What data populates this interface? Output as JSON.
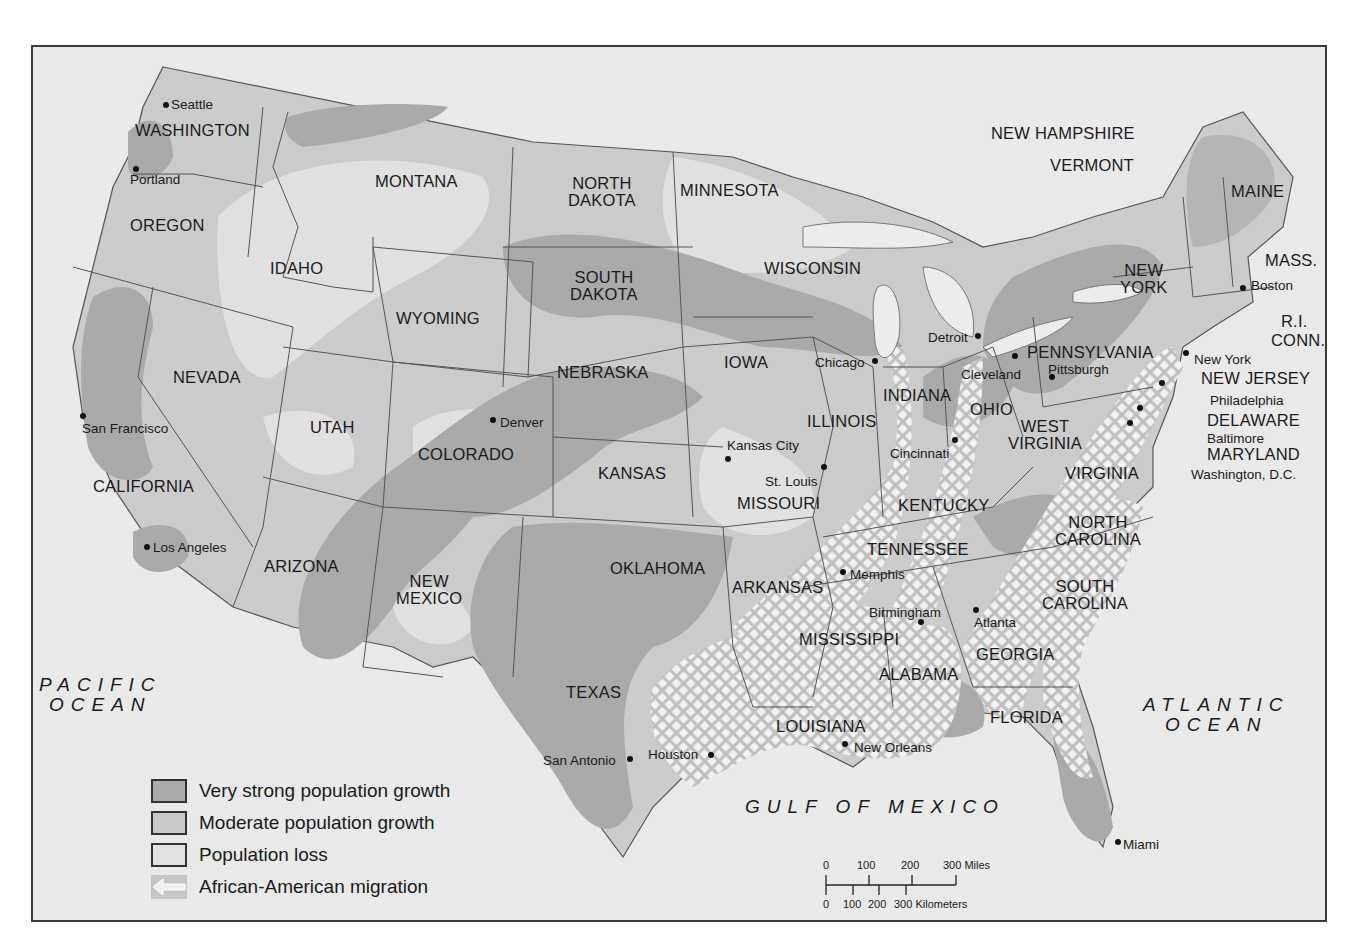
{
  "colors": {
    "frame_bg": "#e6e6e6",
    "very_strong": "#a9a9a9",
    "moderate": "#c9c9c9",
    "loss": "#e2e2e2",
    "migration": "#f4f4f4",
    "border": "#555555",
    "text": "#1a1a1a"
  },
  "states": [
    {
      "id": "washington",
      "label": "WASHINGTON",
      "x": 102,
      "y": 75
    },
    {
      "id": "oregon",
      "label": "OREGON",
      "x": 97,
      "y": 170
    },
    {
      "id": "california",
      "label": "CALIFORNIA",
      "x": 60,
      "y": 431
    },
    {
      "id": "nevada",
      "label": "NEVADA",
      "x": 140,
      "y": 322
    },
    {
      "id": "idaho",
      "label": "IDAHO",
      "x": 237,
      "y": 213
    },
    {
      "id": "montana",
      "label": "MONTANA",
      "x": 342,
      "y": 126
    },
    {
      "id": "wyoming",
      "label": "WYOMING",
      "x": 363,
      "y": 263
    },
    {
      "id": "utah",
      "label": "UTAH",
      "x": 277,
      "y": 372
    },
    {
      "id": "arizona",
      "label": "ARIZONA",
      "x": 231,
      "y": 511
    },
    {
      "id": "colorado",
      "label": "COLORADO",
      "x": 385,
      "y": 399
    },
    {
      "id": "new-mexico",
      "label": "NEW\nMEXICO",
      "x": 363,
      "y": 526
    },
    {
      "id": "north-dakota",
      "label": "NORTH\nDAKOTA",
      "x": 535,
      "y": 128
    },
    {
      "id": "south-dakota",
      "label": "SOUTH\nDAKOTA",
      "x": 537,
      "y": 222
    },
    {
      "id": "nebraska",
      "label": "NEBRASKA",
      "x": 524,
      "y": 317
    },
    {
      "id": "kansas",
      "label": "KANSAS",
      "x": 565,
      "y": 418
    },
    {
      "id": "oklahoma",
      "label": "OKLAHOMA",
      "x": 577,
      "y": 513
    },
    {
      "id": "texas",
      "label": "TEXAS",
      "x": 533,
      "y": 637
    },
    {
      "id": "minnesota",
      "label": "MINNESOTA",
      "x": 647,
      "y": 135
    },
    {
      "id": "iowa",
      "label": "IOWA",
      "x": 691,
      "y": 307
    },
    {
      "id": "missouri",
      "label": "MISSOURI",
      "x": 704,
      "y": 448
    },
    {
      "id": "arkansas",
      "label": "ARKANSAS",
      "x": 699,
      "y": 532
    },
    {
      "id": "louisiana",
      "label": "LOUISIANA",
      "x": 743,
      "y": 671
    },
    {
      "id": "wisconsin",
      "label": "WISCONSIN",
      "x": 731,
      "y": 213
    },
    {
      "id": "illinois",
      "label": "ILLINOIS",
      "x": 774,
      "y": 366
    },
    {
      "id": "indiana",
      "label": "INDIANA",
      "x": 850,
      "y": 340
    },
    {
      "id": "mississippi",
      "label": "MISSISSIPPI",
      "x": 766,
      "y": 584
    },
    {
      "id": "tennessee",
      "label": "TENNESSEE",
      "x": 834,
      "y": 494
    },
    {
      "id": "kentucky",
      "label": "KENTUCKY",
      "x": 865,
      "y": 450
    },
    {
      "id": "alabama",
      "label": "ALABAMA",
      "x": 846,
      "y": 619
    },
    {
      "id": "georgia",
      "label": "GEORGIA",
      "x": 943,
      "y": 599
    },
    {
      "id": "florida",
      "label": "FLORIDA",
      "x": 957,
      "y": 662
    },
    {
      "id": "ohio",
      "label": "OHIO",
      "x": 937,
      "y": 354
    },
    {
      "id": "west-virginia",
      "label": "WEST\nVIRGINIA",
      "x": 975,
      "y": 371
    },
    {
      "id": "virginia",
      "label": "VIRGINIA",
      "x": 1032,
      "y": 418
    },
    {
      "id": "north-carolina",
      "label": "NORTH\nCAROLINA",
      "x": 1022,
      "y": 467
    },
    {
      "id": "south-carolina",
      "label": "SOUTH\nCAROLINA",
      "x": 1009,
      "y": 531
    },
    {
      "id": "pennsylvania",
      "label": "PENNSYLVANIA",
      "x": 994,
      "y": 297
    },
    {
      "id": "new-york",
      "label": "NEW\nYORK",
      "x": 1087,
      "y": 215
    },
    {
      "id": "new-jersey",
      "label": "NEW JERSEY",
      "x": 1168,
      "y": 323
    },
    {
      "id": "delaware",
      "label": "DELAWARE",
      "x": 1174,
      "y": 365
    },
    {
      "id": "maryland",
      "label": "MARYLAND",
      "x": 1174,
      "y": 399
    },
    {
      "id": "maine",
      "label": "MAINE",
      "x": 1198,
      "y": 136
    },
    {
      "id": "mass",
      "label": "MASS.",
      "x": 1232,
      "y": 205
    },
    {
      "id": "ri",
      "label": "R.I.",
      "x": 1248,
      "y": 266
    },
    {
      "id": "conn",
      "label": "CONN.",
      "x": 1238,
      "y": 285
    },
    {
      "id": "new-hampshire",
      "label": "NEW HAMPSHIRE",
      "x": 958,
      "y": 78
    },
    {
      "id": "vermont",
      "label": "VERMONT",
      "x": 1017,
      "y": 110
    }
  ],
  "cities": [
    {
      "id": "seattle",
      "label": "Seattle",
      "dx": 133,
      "dy": 58,
      "lx": 138,
      "ly": 51
    },
    {
      "id": "portland",
      "label": "Portland",
      "dx": 103,
      "dy": 122,
      "lx": 97,
      "ly": 126
    },
    {
      "id": "san-francisco",
      "label": "San Francisco",
      "dx": 50,
      "dy": 369,
      "lx": 49,
      "ly": 375
    },
    {
      "id": "los-angeles",
      "label": "Los Angeles",
      "dx": 114,
      "dy": 500,
      "lx": 120,
      "ly": 494
    },
    {
      "id": "denver",
      "label": "Denver",
      "dx": 460,
      "dy": 373,
      "lx": 467,
      "ly": 369
    },
    {
      "id": "kansas-city",
      "label": "Kansas City",
      "dx": 695,
      "dy": 412,
      "lx": 694,
      "ly": 392
    },
    {
      "id": "st-louis",
      "label": "St. Louis",
      "dx": 791,
      "dy": 420,
      "lx": 732,
      "ly": 428
    },
    {
      "id": "chicago",
      "label": "Chicago",
      "dx": 842,
      "dy": 314,
      "lx": 782,
      "ly": 309
    },
    {
      "id": "detroit",
      "label": "Detroit",
      "dx": 945,
      "dy": 289,
      "lx": 895,
      "ly": 284
    },
    {
      "id": "cleveland",
      "label": "Cleveland",
      "dx": 982,
      "dy": 309,
      "lx": 928,
      "ly": 321
    },
    {
      "id": "pittsburgh",
      "label": "Pittsburgh",
      "dx": 1019,
      "dy": 330,
      "lx": 1015,
      "ly": 316
    },
    {
      "id": "cincinnati",
      "label": "Cincinnati",
      "dx": 922,
      "dy": 393,
      "lx": 857,
      "ly": 400
    },
    {
      "id": "memphis",
      "label": "Memphis",
      "dx": 810,
      "dy": 525,
      "lx": 817,
      "ly": 521
    },
    {
      "id": "birmingham",
      "label": "Birmingham",
      "dx": 888,
      "dy": 575,
      "lx": 836,
      "ly": 559
    },
    {
      "id": "atlanta",
      "label": "Atlanta",
      "dx": 943,
      "dy": 563,
      "lx": 941,
      "ly": 569
    },
    {
      "id": "new-orleans",
      "label": "New Orleans",
      "dx": 812,
      "dy": 697,
      "lx": 821,
      "ly": 694
    },
    {
      "id": "houston",
      "label": "Houston",
      "dx": 678,
      "dy": 708,
      "lx": 615,
      "ly": 701
    },
    {
      "id": "san-antonio",
      "label": "San Antonio",
      "dx": 597,
      "dy": 712,
      "lx": 510,
      "ly": 707
    },
    {
      "id": "miami",
      "label": "Miami",
      "dx": 1085,
      "dy": 795,
      "lx": 1090,
      "ly": 791
    },
    {
      "id": "boston",
      "label": "Boston",
      "dx": 1210,
      "dy": 241,
      "lx": 1218,
      "ly": 232
    },
    {
      "id": "new-york-city",
      "label": "New York",
      "dx": 1153,
      "dy": 306,
      "lx": 1161,
      "ly": 306
    },
    {
      "id": "philadelphia",
      "label": "Philadelphia",
      "dx": 1129,
      "dy": 336,
      "lx": 1177,
      "ly": 347
    },
    {
      "id": "baltimore",
      "label": "Baltimore",
      "dx": 1107,
      "dy": 361,
      "lx": 1174,
      "ly": 385
    },
    {
      "id": "washington-dc",
      "label": "Washington, D.C.",
      "dx": 1097,
      "dy": 376,
      "lx": 1158,
      "ly": 421
    }
  ],
  "oceans": [
    {
      "id": "pacific-ocean",
      "label": "PACIFIC\nOCEAN",
      "x": 6,
      "y": 628
    },
    {
      "id": "atlantic-ocean",
      "label": "ATLANTIC\nOCEAN",
      "x": 1110,
      "y": 648
    },
    {
      "id": "gulf-of-mexico",
      "label": "GULF OF MEXICO",
      "x": 712,
      "y": 750
    }
  ],
  "legend": {
    "items": [
      {
        "id": "very-strong",
        "label": "Very strong population growth",
        "swatch": "very_strong"
      },
      {
        "id": "moderate",
        "label": "Moderate population growth",
        "swatch": "moderate"
      },
      {
        "id": "loss",
        "label": "Population loss",
        "swatch": "loss"
      },
      {
        "id": "migration",
        "label": "African-American migration",
        "swatch": "migration"
      }
    ]
  },
  "scale_bar": {
    "miles_ticks": [
      "0",
      "100",
      "200",
      "300 Miles"
    ],
    "km_ticks": [
      "0",
      "100",
      "200",
      "300 Kilometers"
    ]
  }
}
